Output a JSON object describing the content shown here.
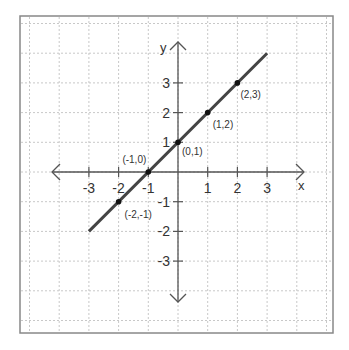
{
  "chart_data": {
    "type": "line",
    "title": "",
    "xlabel": "x",
    "ylabel": "y",
    "xlim": [
      -5,
      5
    ],
    "ylim": [
      -5,
      5
    ],
    "grid": true,
    "x_ticks": [
      -3,
      -2,
      -1,
      1,
      2,
      3
    ],
    "y_ticks": [
      3,
      2,
      1,
      -1,
      -2,
      -3
    ],
    "x_tick_labels": [
      "-3",
      "-2",
      "-1",
      "1",
      "2",
      "3"
    ],
    "y_tick_labels": [
      "3",
      "2",
      "1",
      "-1",
      "-2",
      "-3"
    ],
    "series": [
      {
        "name": "y = x + 1",
        "x": [
          -3,
          3
        ],
        "y": [
          -2,
          4
        ],
        "color": "#444444"
      }
    ],
    "points": [
      {
        "x": -2,
        "y": -1,
        "label": "(-2,-1)"
      },
      {
        "x": -1,
        "y": 0,
        "label": "(-1,0)"
      },
      {
        "x": 0,
        "y": 1,
        "label": "(0,1)"
      },
      {
        "x": 1,
        "y": 2,
        "label": "(1,2)"
      },
      {
        "x": 2,
        "y": 3,
        "label": "(2,3)"
      }
    ],
    "colors": {
      "line": "#444444",
      "axis": "#555555",
      "grid": "#c8c8c8",
      "border": "#888888",
      "point": "#111111"
    }
  }
}
